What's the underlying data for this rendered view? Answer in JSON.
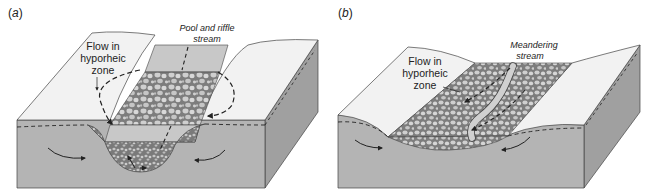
{
  "colors": {
    "surface": "#f2f2f2",
    "soil_front": "#b4b4b4",
    "soil_side": "#a0a0a0",
    "gravel_bg": "#7d7d7d",
    "gravel_stone": "#cfcfcf",
    "water": "#c8c8c8",
    "line": "#333333"
  },
  "panels": [
    {
      "id": "a",
      "label_open": "(",
      "label_letter": "a",
      "label_close": ")",
      "labels": {
        "flow_line1": "Flow in",
        "flow_line2": "hyporheic",
        "flow_line3": "zone",
        "stream_line1": "Pool and riffle",
        "stream_line2": "stream"
      }
    },
    {
      "id": "b",
      "label_open": "(",
      "label_letter": "b",
      "label_close": ")",
      "labels": {
        "flow_line1": "Flow in",
        "flow_line2": "hyporheic",
        "flow_line3": "zone",
        "stream_line1": "Meandering",
        "stream_line2": "stream"
      }
    }
  ]
}
